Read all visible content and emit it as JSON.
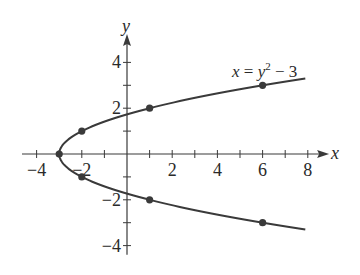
{
  "chart_data": {
    "type": "line",
    "title": "",
    "equation": "x = y² − 3",
    "equation_parts": {
      "lhs": "x",
      "eq": " = ",
      "var": "y",
      "exp": "2",
      "rest": " − 3"
    },
    "xlabel": "x",
    "ylabel": "y",
    "xlim": [
      -4.5,
      8.5
    ],
    "ylim": [
      -4.5,
      4.8
    ],
    "x_ticks": [
      -4,
      -3,
      -2,
      -1,
      0,
      1,
      2,
      3,
      4,
      5,
      6,
      7,
      8
    ],
    "x_tick_labels": [
      "-4",
      "-2",
      "2",
      "4",
      "6",
      "8"
    ],
    "x_tick_label_values": [
      -4,
      -2,
      2,
      4,
      6,
      8
    ],
    "y_ticks": [
      -4,
      -3,
      -2,
      -1,
      1,
      2,
      3,
      4
    ],
    "y_tick_labels": [
      "4",
      "2",
      "-2",
      "-4"
    ],
    "y_tick_label_values": [
      4,
      2,
      -2,
      -4
    ],
    "grid": false,
    "series": [
      {
        "name": "x = y^2 - 3",
        "curve": "parabola",
        "y_range": [
          -3.3,
          3.3
        ],
        "points": [
          {
            "x": -3,
            "y": 0
          },
          {
            "x": -2,
            "y": 1
          },
          {
            "x": -2,
            "y": -1
          },
          {
            "x": 1,
            "y": 2
          },
          {
            "x": 1,
            "y": -2
          },
          {
            "x": 6,
            "y": 3
          },
          {
            "x": 6,
            "y": -3
          }
        ]
      }
    ]
  },
  "colors": {
    "curve": "#3a3a3a",
    "axis": "#3a3a3a",
    "text": "#2a2a2a",
    "background": "#ffffff"
  }
}
